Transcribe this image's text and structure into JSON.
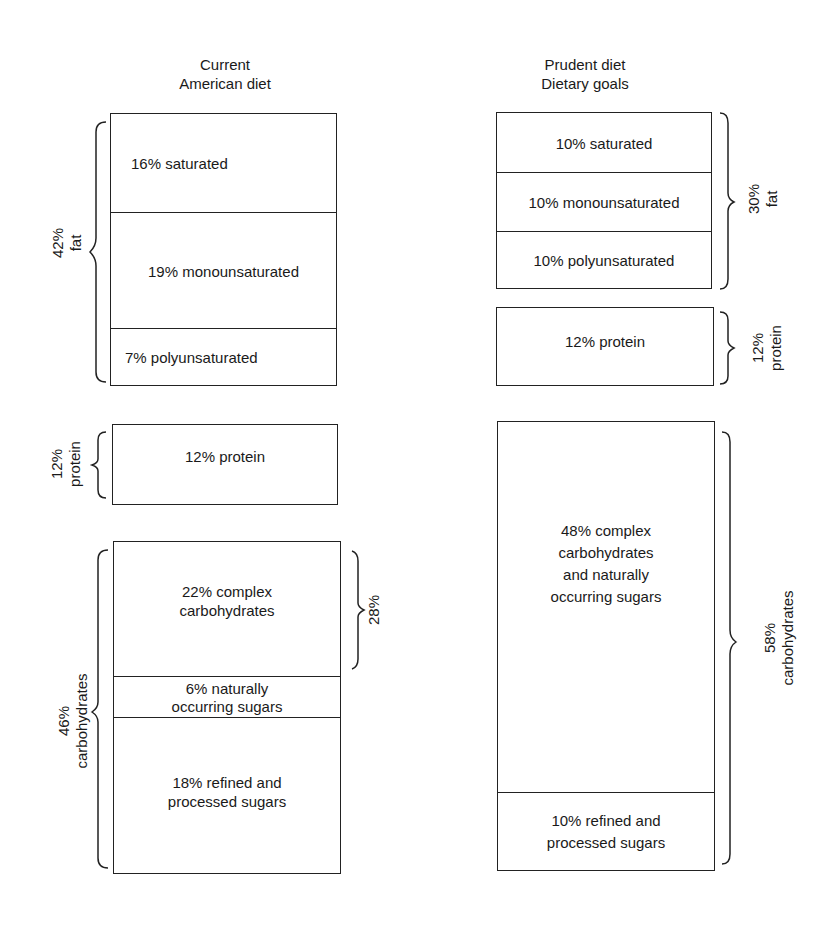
{
  "figure": {
    "left_column": {
      "title_line1": "Current",
      "title_line2": "American diet",
      "fat": {
        "group_label_pct": "42%",
        "group_label_name": "fat",
        "segments": [
          {
            "label": "16% saturated"
          },
          {
            "label": "19% monounsaturated"
          },
          {
            "label": "7% polyunsaturated"
          }
        ]
      },
      "protein": {
        "group_label_pct": "12%",
        "group_label_name": "protein",
        "segments": [
          {
            "label": "12% protein"
          }
        ]
      },
      "carbohydrates": {
        "group_label_pct": "46%",
        "group_label_name": "carbohydrates",
        "subgroup_label": "28%",
        "segments": [
          {
            "line1": "22% complex",
            "line2": "carbohydrates"
          },
          {
            "line1": "6% naturally",
            "line2": "occurring sugars"
          },
          {
            "line1": "18% refined and",
            "line2": "processed sugars"
          }
        ]
      }
    },
    "right_column": {
      "title_line1": "Prudent diet",
      "title_line2": "Dietary goals",
      "fat": {
        "group_label_pct": "30%",
        "group_label_name": "fat",
        "segments": [
          {
            "label": "10% saturated"
          },
          {
            "label": "10% monounsaturated"
          },
          {
            "label": "10% polyunsaturated"
          }
        ]
      },
      "protein": {
        "group_label_pct": "12%",
        "group_label_name": "protein",
        "segments": [
          {
            "label": "12% protein"
          }
        ]
      },
      "carbohydrates": {
        "group_label_pct": "58%",
        "group_label_name": "carbohydrates",
        "segments": [
          {
            "line1": "48% complex",
            "line2": "carbohydrates",
            "line3": "and naturally",
            "line4": "occurring sugars"
          },
          {
            "line1": "10% refined and",
            "line2": "processed sugars"
          }
        ]
      }
    }
  }
}
